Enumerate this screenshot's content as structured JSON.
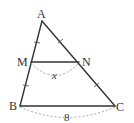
{
  "diagram": {
    "type": "triangle-midpoint",
    "points": {
      "A": {
        "label": "A"
      },
      "B": {
        "label": "B"
      },
      "C": {
        "label": "C"
      },
      "M": {
        "label": "M"
      },
      "N": {
        "label": "N"
      }
    },
    "segments": [
      {
        "from": "A",
        "to": "B",
        "name": "side-ab"
      },
      {
        "from": "A",
        "to": "C",
        "name": "side-ac"
      },
      {
        "from": "B",
        "to": "C",
        "name": "side-bc"
      },
      {
        "from": "M",
        "to": "N",
        "name": "segment-mn"
      }
    ],
    "equal_marks": [
      {
        "segment": "AM",
        "group": 1
      },
      {
        "segment": "MB",
        "group": 1
      },
      {
        "segment": "AN",
        "group": 2
      },
      {
        "segment": "NC",
        "group": 2
      }
    ],
    "measurements": {
      "MN": "x",
      "BC": "8"
    }
  }
}
